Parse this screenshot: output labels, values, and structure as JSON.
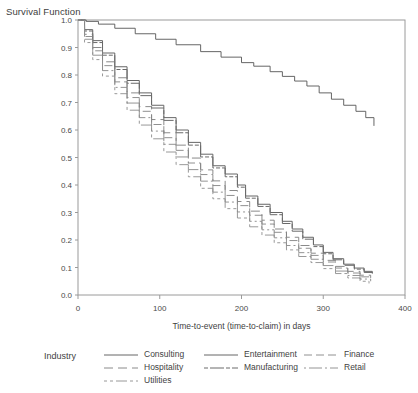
{
  "chart_data": {
    "type": "line",
    "title": "Survival Function",
    "xlabel": "Time-to-event (time-to-claim) in days",
    "ylabel": "Survival Function",
    "xlim": [
      0,
      400
    ],
    "ylim": [
      0.0,
      1.0
    ],
    "xticks": [
      "0",
      "100",
      "200",
      "300",
      "400"
    ],
    "xtick_values": [
      0,
      100,
      200,
      300,
      400
    ],
    "yticks": [
      "0.0",
      "0.1",
      "0.2",
      "0.3",
      "0.4",
      "0.5",
      "0.6",
      "0.7",
      "0.8",
      "0.9",
      "1.0"
    ],
    "ytick_values": [
      0.0,
      0.1,
      0.2,
      0.3,
      0.4,
      0.5,
      0.6,
      0.7,
      0.8,
      0.9,
      1.0
    ],
    "grid": false,
    "legend_position": "bottom",
    "legend_title": "Industry",
    "series": [
      {
        "name": "Consulting",
        "dash": "none",
        "color": "#555555",
        "width": 0.9,
        "x": [
          0,
          10,
          25,
          45,
          70,
          95,
          120,
          150,
          175,
          200,
          215,
          235,
          250,
          265,
          280,
          295,
          310,
          325,
          340,
          352,
          362
        ],
        "y": [
          1.0,
          0.995,
          0.985,
          0.97,
          0.95,
          0.93,
          0.91,
          0.885,
          0.865,
          0.845,
          0.832,
          0.812,
          0.795,
          0.778,
          0.76,
          0.735,
          0.712,
          0.69,
          0.668,
          0.645,
          0.615
        ]
      },
      {
        "name": "Entertainment",
        "dash": "none",
        "color": "#666666",
        "width": 1.0,
        "x": [
          0,
          8,
          18,
          30,
          45,
          60,
          75,
          90,
          105,
          120,
          135,
          150,
          165,
          180,
          195,
          205,
          220,
          235,
          250,
          262,
          275,
          288,
          300,
          312,
          325,
          338,
          350,
          360
        ],
        "y": [
          1.0,
          0.965,
          0.925,
          0.88,
          0.83,
          0.78,
          0.735,
          0.69,
          0.645,
          0.6,
          0.555,
          0.512,
          0.47,
          0.44,
          0.4,
          0.36,
          0.33,
          0.3,
          0.268,
          0.24,
          0.21,
          0.182,
          0.155,
          0.132,
          0.112,
          0.098,
          0.086,
          0.08
        ]
      },
      {
        "name": "Manufacturing",
        "dash": "4 2 14 2",
        "color": "#6a6a6a",
        "width": 1.0,
        "x": [
          0,
          8,
          18,
          30,
          45,
          60,
          75,
          90,
          105,
          120,
          135,
          150,
          165,
          180,
          195,
          205,
          220,
          235,
          250,
          262,
          275,
          288,
          300,
          312,
          325,
          338,
          350,
          360
        ],
        "y": [
          1.0,
          0.96,
          0.918,
          0.872,
          0.82,
          0.77,
          0.725,
          0.68,
          0.635,
          0.59,
          0.545,
          0.502,
          0.462,
          0.43,
          0.392,
          0.352,
          0.322,
          0.292,
          0.26,
          0.232,
          0.203,
          0.176,
          0.15,
          0.128,
          0.108,
          0.094,
          0.082,
          0.076
        ]
      },
      {
        "name": "Hospitality",
        "dash": "9 5",
        "color": "#7d7d7d",
        "width": 0.9,
        "x": [
          0,
          8,
          18,
          30,
          45,
          60,
          75,
          90,
          105,
          120,
          135,
          150,
          165,
          180,
          195,
          210,
          225,
          240,
          255,
          270,
          285,
          300,
          315,
          330,
          345,
          358
        ],
        "y": [
          1.0,
          0.948,
          0.9,
          0.848,
          0.79,
          0.735,
          0.685,
          0.638,
          0.59,
          0.545,
          0.498,
          0.455,
          0.415,
          0.38,
          0.34,
          0.305,
          0.272,
          0.24,
          0.21,
          0.18,
          0.152,
          0.126,
          0.104,
          0.086,
          0.072,
          0.062
        ]
      },
      {
        "name": "Finance",
        "dash": "8 4 8 4",
        "color": "#838383",
        "width": 0.9,
        "x": [
          0,
          8,
          18,
          30,
          45,
          60,
          75,
          90,
          105,
          120,
          135,
          150,
          165,
          180,
          195,
          210,
          225,
          240,
          255,
          270,
          285,
          300,
          315,
          330,
          345,
          358
        ],
        "y": [
          1.0,
          0.94,
          0.888,
          0.834,
          0.775,
          0.718,
          0.668,
          0.62,
          0.572,
          0.526,
          0.48,
          0.438,
          0.398,
          0.362,
          0.325,
          0.29,
          0.258,
          0.228,
          0.198,
          0.17,
          0.144,
          0.12,
          0.098,
          0.08,
          0.066,
          0.058
        ]
      },
      {
        "name": "Retail",
        "dash": "2 3 13 3",
        "color": "#888888",
        "width": 0.9,
        "x": [
          0,
          8,
          18,
          30,
          45,
          60,
          75,
          90,
          105,
          120,
          135,
          150,
          165,
          180,
          195,
          210,
          225,
          240,
          255,
          270,
          285,
          300,
          315,
          330,
          345,
          358
        ],
        "y": [
          1.0,
          0.93,
          0.872,
          0.816,
          0.755,
          0.698,
          0.645,
          0.596,
          0.548,
          0.502,
          0.456,
          0.414,
          0.374,
          0.338,
          0.302,
          0.268,
          0.237,
          0.208,
          0.18,
          0.154,
          0.13,
          0.107,
          0.087,
          0.071,
          0.058,
          0.05
        ]
      },
      {
        "name": "Utilities",
        "dash": "3 3 3 3 11 3",
        "color": "#8d8d8d",
        "width": 0.9,
        "x": [
          0,
          8,
          18,
          30,
          45,
          60,
          75,
          90,
          105,
          120,
          135,
          150,
          165,
          180,
          195,
          210,
          225,
          240,
          255,
          270,
          285,
          300,
          315,
          330,
          345,
          356
        ],
        "y": [
          1.0,
          0.918,
          0.856,
          0.796,
          0.732,
          0.672,
          0.618,
          0.568,
          0.52,
          0.474,
          0.43,
          0.388,
          0.35,
          0.314,
          0.28,
          0.248,
          0.218,
          0.19,
          0.164,
          0.14,
          0.118,
          0.096,
          0.078,
          0.062,
          0.05,
          0.042
        ]
      }
    ]
  },
  "legend": {
    "title": "Industry",
    "columns": [
      [
        "Consulting",
        "Hospitality",
        "Utilities"
      ],
      [
        "Entertainment",
        "Manufacturing"
      ],
      [
        "Finance",
        "Retail"
      ]
    ]
  }
}
